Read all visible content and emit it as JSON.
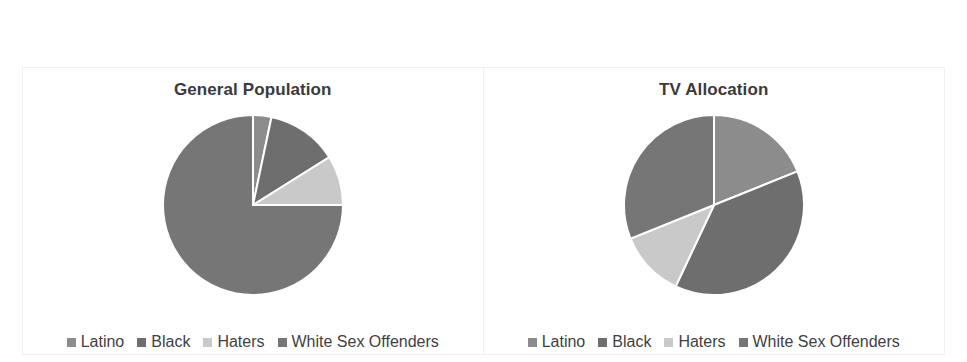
{
  "colors": {
    "latino": "#8c8c8c",
    "black": "#6e6e6e",
    "haters": "#c9c9c9",
    "white_sex_offenders": "#767676",
    "slice_border": "#ffffff",
    "title_text": "#3a3a3a",
    "legend_text": "#3f3f3f",
    "panel_border": "#f0f0f0",
    "background": "#ffffff"
  },
  "legend": {
    "items": [
      {
        "label": "Latino",
        "marker": "square-marker",
        "color": "#8c8c8c"
      },
      {
        "label": "Black",
        "marker": "square-marker",
        "color": "#6e6e6e"
      },
      {
        "label": "Haters",
        "marker": "square-marker",
        "color": "#c9c9c9"
      },
      {
        "label": "White Sex Offenders",
        "marker": "square-marker",
        "color": "#767676"
      }
    ]
  },
  "chart_data": [
    {
      "type": "pie",
      "title": "General Population",
      "labels": [
        "Latino",
        "Black",
        "Haters",
        "White Sex Offenders"
      ],
      "values": [
        3.3,
        12.8,
        8.9,
        75.0
      ],
      "unit": "percent",
      "start_angle": 0,
      "direction": "clockwise",
      "colors": [
        "#8c8c8c",
        "#6e6e6e",
        "#c9c9c9",
        "#767676"
      ],
      "legend_position": "bottom",
      "grid": false
    },
    {
      "type": "pie",
      "title": "TV Allocation",
      "labels": [
        "Latino",
        "Black",
        "Haters",
        "White Sex Offenders"
      ],
      "values": [
        18.9,
        38.1,
        11.9,
        31.1
      ],
      "unit": "percent",
      "start_angle": 0,
      "direction": "clockwise",
      "colors": [
        "#8c8c8c",
        "#6e6e6e",
        "#c9c9c9",
        "#767676"
      ],
      "legend_position": "bottom",
      "grid": false
    }
  ]
}
